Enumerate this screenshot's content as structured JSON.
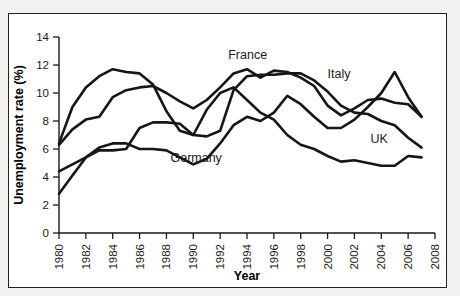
{
  "figure": {
    "background_color": "#f2f1ef",
    "panel_color": "#ffffff",
    "border_color": "#222222"
  },
  "chart_data": {
    "type": "line",
    "title": "",
    "xlabel": "Year",
    "ylabel": "Unemployment rate (%)",
    "xlim": [
      1980,
      2008
    ],
    "ylim": [
      0,
      14
    ],
    "xticks": [
      1980,
      1982,
      1984,
      1986,
      1988,
      1990,
      1992,
      1994,
      1996,
      1998,
      2000,
      2002,
      2004,
      2006,
      2008
    ],
    "yticks": [
      0,
      2,
      4,
      6,
      8,
      10,
      12,
      14
    ],
    "xtick_labels": [
      "1980",
      "1982",
      "1984",
      "1986",
      "1988",
      "1990",
      "1992",
      "1994",
      "1996",
      "1998",
      "2000",
      "2002",
      "2004",
      "2006",
      "2008"
    ],
    "ytick_labels": [
      "0",
      "2",
      "4",
      "6",
      "8",
      "10",
      "12",
      "14"
    ],
    "grid": false,
    "legend": "inline-labels",
    "line_color": "#161616",
    "x": [
      1980,
      1981,
      1982,
      1983,
      1984,
      1985,
      1986,
      1987,
      1988,
      1989,
      1990,
      1991,
      1992,
      1993,
      1994,
      1995,
      1996,
      1997,
      1998,
      1999,
      2000,
      2001,
      2002,
      2003,
      2004,
      2005,
      2006,
      2007
    ],
    "series": [
      {
        "name": "UK",
        "label": "UK",
        "label_x": 2003.2,
        "label_y": 6.4,
        "values": [
          6.4,
          9.0,
          10.4,
          11.2,
          11.7,
          11.5,
          11.4,
          10.6,
          8.7,
          7.3,
          7.0,
          8.8,
          10.0,
          10.4,
          9.5,
          8.6,
          8.1,
          7.0,
          6.3,
          6.0,
          5.5,
          5.1,
          5.2,
          5.0,
          4.8,
          4.8,
          5.5,
          5.4
        ]
      },
      {
        "name": "France",
        "label": "France",
        "label_x": 1992.6,
        "label_y": 12.4,
        "values": [
          6.3,
          7.4,
          8.1,
          8.3,
          9.7,
          10.2,
          10.4,
          10.5,
          10.0,
          9.4,
          8.9,
          9.5,
          10.4,
          11.4,
          11.7,
          11.1,
          11.6,
          11.5,
          11.1,
          10.5,
          9.1,
          8.4,
          8.9,
          9.5,
          9.6,
          9.3,
          9.2,
          8.3
        ]
      },
      {
        "name": "Italy",
        "label": "Italy",
        "label_x": 2000.0,
        "label_y": 11.1,
        "values": [
          4.4,
          4.9,
          5.4,
          5.9,
          5.9,
          6.0,
          7.5,
          7.9,
          7.9,
          7.8,
          7.0,
          6.9,
          7.3,
          10.2,
          11.2,
          11.3,
          11.3,
          11.4,
          11.4,
          10.9,
          10.1,
          9.1,
          8.6,
          8.5,
          8.0,
          7.7,
          6.8,
          6.1
        ]
      },
      {
        "name": "Germany",
        "label": "Germany",
        "label_x": 1988.3,
        "label_y": 5.1,
        "values": [
          2.8,
          4.1,
          5.4,
          6.1,
          6.4,
          6.4,
          6.0,
          6.0,
          5.9,
          5.4,
          4.9,
          5.3,
          6.4,
          7.7,
          8.3,
          8.0,
          8.6,
          9.8,
          9.2,
          8.3,
          7.5,
          7.5,
          8.1,
          9.0,
          10.0,
          11.5,
          9.7,
          8.3
        ]
      }
    ]
  }
}
